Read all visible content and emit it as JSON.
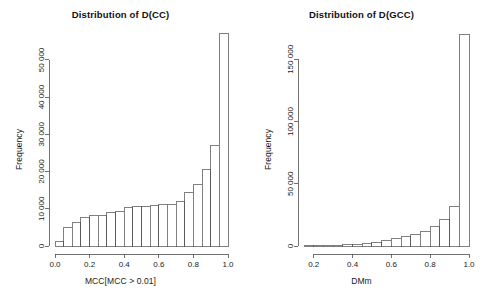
{
  "figure": {
    "background": "#ffffff",
    "foreground": "#1a1a1a",
    "panel_count": 2
  },
  "chart_data": [
    {
      "type": "bar",
      "id": "left-histogram",
      "title": "Distribution of D(CC)",
      "xlabel": "MCC[MCC > 0.01]",
      "ylabel": "Frequency",
      "grid": false,
      "legend": false,
      "xlim": [
        0.0,
        1.0
      ],
      "ylim": [
        0,
        57500
      ],
      "xticks": [
        0.0,
        0.2,
        0.4,
        0.6,
        0.8,
        1.0
      ],
      "xtick_labels": [
        "0.0",
        "0.2",
        "0.4",
        "0.6",
        "0.8",
        "1.0"
      ],
      "yticks": [
        0,
        10000,
        20000,
        30000,
        40000,
        50000
      ],
      "ytick_labels": [
        "0",
        "10 000",
        "20 000",
        "30 000",
        "40 000",
        "50 000"
      ],
      "bin_width": 0.05,
      "bin_edges": [
        0.0,
        0.05,
        0.1,
        0.15,
        0.2,
        0.25,
        0.3,
        0.35,
        0.4,
        0.45,
        0.5,
        0.55,
        0.6,
        0.65,
        0.7,
        0.75,
        0.8,
        0.85,
        0.9,
        0.95,
        1.0
      ],
      "categories": [
        "0.00-0.05",
        "0.05-0.10",
        "0.10-0.15",
        "0.15-0.20",
        "0.20-0.25",
        "0.25-0.30",
        "0.30-0.35",
        "0.35-0.40",
        "0.40-0.45",
        "0.45-0.50",
        "0.50-0.55",
        "0.55-0.60",
        "0.60-0.65",
        "0.65-0.70",
        "0.70-0.75",
        "0.75-0.80",
        "0.80-0.85",
        "0.85-0.90",
        "0.90-0.95",
        "0.95-1.00"
      ],
      "values": [
        1100,
        5100,
        6400,
        7600,
        8300,
        8300,
        9000,
        9400,
        10400,
        10500,
        10700,
        11000,
        11200,
        11200,
        12000,
        14400,
        16400,
        20600,
        27000,
        57000
      ]
    },
    {
      "type": "bar",
      "id": "right-histogram",
      "title": "Distribution of D(GCC)",
      "xlabel": "DMm",
      "ylabel": "Frequency",
      "grid": false,
      "legend": false,
      "xlim": [
        0.15,
        1.0
      ],
      "ylim": [
        0,
        172000
      ],
      "xticks": [
        0.2,
        0.4,
        0.6,
        0.8,
        1.0
      ],
      "xtick_labels": [
        "0.2",
        "0.4",
        "0.6",
        "0.8",
        "1.0"
      ],
      "yticks": [
        0,
        50000,
        100000,
        150000
      ],
      "ytick_labels": [
        "0",
        "50 000",
        "100 000",
        "150 000"
      ],
      "bin_width": 0.05,
      "bin_edges": [
        0.15,
        0.2,
        0.25,
        0.3,
        0.35,
        0.4,
        0.45,
        0.5,
        0.55,
        0.6,
        0.65,
        0.7,
        0.75,
        0.8,
        0.85,
        0.9,
        0.95,
        1.0
      ],
      "categories": [
        "0.15-0.20",
        "0.20-0.25",
        "0.25-0.30",
        "0.30-0.35",
        "0.35-0.40",
        "0.40-0.45",
        "0.45-0.50",
        "0.50-0.55",
        "0.55-0.60",
        "0.60-0.65",
        "0.65-0.70",
        "0.70-0.75",
        "0.75-0.80",
        "0.80-0.85",
        "0.85-0.90",
        "0.90-0.95",
        "0.95-1.00"
      ],
      "values": [
        200,
        300,
        500,
        700,
        1000,
        1600,
        2200,
        3200,
        4300,
        5700,
        7300,
        9300,
        11800,
        15500,
        21500,
        32000,
        170000
      ]
    }
  ]
}
